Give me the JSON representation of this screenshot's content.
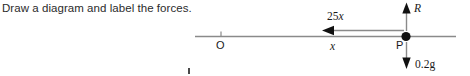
{
  "prompt": {
    "text": "Draw a diagram and label the forces."
  },
  "diagram": {
    "labels": {
      "force_horizontal": "25",
      "force_horizontal_var": "x",
      "force_normal": "R",
      "force_weight": "0.2g",
      "origin": "O",
      "point": "P",
      "distance": "x"
    },
    "colors": {
      "ink": "#1a1a1a",
      "line": "#8a8a8a",
      "text": "#2b2b2b"
    }
  }
}
